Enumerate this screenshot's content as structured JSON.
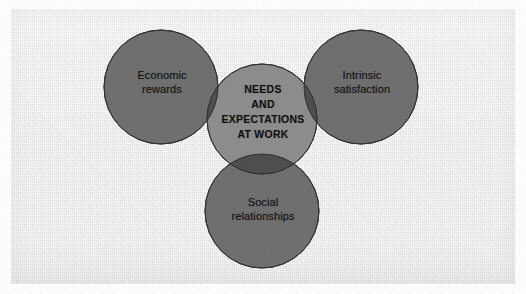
{
  "figure": {
    "kind": "venn-diagram",
    "title_text": "NEEDS\nAND\nEXPECTATIONS\nAT WORK",
    "background_color": "#e9e9e9",
    "circle_fill_color": "#6e6e6e",
    "overlap_pair_color": "#4a4a4a",
    "overlap_triple_color": "#8a8a8a",
    "circle_stroke_color": "#2e2e2e",
    "label_color": "#101010"
  },
  "circles": [
    {
      "id": "economic-rewards",
      "label": "Economic\nrewards",
      "position": "left",
      "cx": 161,
      "cy": 87,
      "r": 57
    },
    {
      "id": "intrinsic-satisfaction",
      "label": "Intrinsic\nsatisfaction",
      "position": "right",
      "cx": 361,
      "cy": 87,
      "r": 57
    },
    {
      "id": "social-relationships",
      "label": "Social\nrelationships",
      "position": "bottom",
      "cx": 262,
      "cy": 211,
      "r": 57
    },
    {
      "id": "needs-and-expectations",
      "label": "NEEDS\nAND\nEXPECTATIONS\nAT WORK",
      "position": "center",
      "cx": 262,
      "cy": 119,
      "r": 55
    }
  ]
}
